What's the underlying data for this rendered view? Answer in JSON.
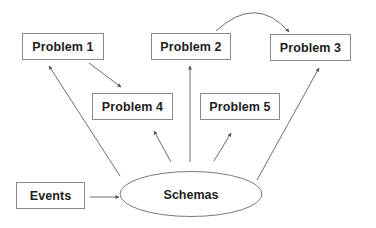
{
  "diagram": {
    "type": "concept-map",
    "nodes": [
      {
        "id": "problem1",
        "label": "Problem 1",
        "shape": "rect"
      },
      {
        "id": "problem2",
        "label": "Problem 2",
        "shape": "rect"
      },
      {
        "id": "problem3",
        "label": "Problem 3",
        "shape": "rect"
      },
      {
        "id": "problem4",
        "label": "Problem 4",
        "shape": "rect"
      },
      {
        "id": "problem5",
        "label": "Problem 5",
        "shape": "rect"
      },
      {
        "id": "events",
        "label": "Events",
        "shape": "rect"
      },
      {
        "id": "schemas",
        "label": "Schemas",
        "shape": "ellipse"
      }
    ],
    "edges": [
      {
        "from": "events",
        "to": "schemas",
        "style": "straight-arrow"
      },
      {
        "from": "schemas",
        "to": "problem1",
        "style": "straight-arrow"
      },
      {
        "from": "schemas",
        "to": "problem2",
        "style": "straight-arrow"
      },
      {
        "from": "schemas",
        "to": "problem3",
        "style": "straight-arrow"
      },
      {
        "from": "schemas",
        "to": "problem4",
        "style": "straight-arrow"
      },
      {
        "from": "schemas",
        "to": "problem5",
        "style": "straight-arrow"
      },
      {
        "from": "problem1",
        "to": "problem4",
        "style": "straight-arrow"
      },
      {
        "from": "problem2",
        "to": "problem3",
        "style": "curved-arrow"
      }
    ],
    "colors": {
      "line": "#6e6e6e",
      "border": "#8a8a8a",
      "text": "#1e1e1e",
      "background": "#ffffff"
    }
  }
}
